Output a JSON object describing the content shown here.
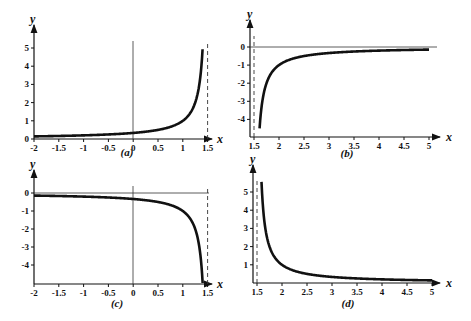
{
  "chart_data": [
    {
      "type": "line",
      "caption": "(a)",
      "xlabel": "x",
      "ylabel": "y",
      "xlim": [
        -2,
        1.5
      ],
      "ylim": [
        0,
        5.3
      ],
      "xticks": [
        "-2",
        "-1.5",
        "-1",
        "-0.5",
        "0",
        "0.5",
        "1",
        "1.5"
      ],
      "yticks": [
        "0",
        "1",
        "2",
        "3",
        "4",
        "5"
      ],
      "asymptote_x": 1.5,
      "function": "y = 1/(3-2x)",
      "x": [
        -2,
        -1.5,
        -1,
        -0.5,
        0,
        0.5,
        1,
        1.25,
        1.4
      ],
      "values": [
        0.14,
        0.17,
        0.2,
        0.25,
        0.33,
        0.5,
        1,
        2,
        5
      ]
    },
    {
      "type": "line",
      "caption": "(b)",
      "xlabel": "x",
      "ylabel": "y",
      "xlim": [
        1.45,
        5
      ],
      "ylim": [
        -4.9,
        0.5
      ],
      "xticks": [
        "1.5",
        "2",
        "2.5",
        "3",
        "3.5",
        "4",
        "4.5",
        "5"
      ],
      "yticks": [
        "0",
        "-1",
        "-2",
        "-3",
        "-4"
      ],
      "asymptote_x": 1.5,
      "function": "y = 1/(3-2x)",
      "x": [
        1.6,
        1.75,
        2,
        2.5,
        3,
        3.5,
        4,
        4.5,
        5
      ],
      "values": [
        -5,
        -2,
        -1,
        -0.5,
        -0.33,
        -0.25,
        -0.2,
        -0.17,
        -0.14
      ]
    },
    {
      "type": "line",
      "caption": "(c)",
      "xlabel": "x",
      "ylabel": "y",
      "xlim": [
        -2,
        1.5
      ],
      "ylim": [
        -5,
        0.3
      ],
      "xticks": [
        "-2",
        "-1.5",
        "-1",
        "-0.5",
        "0",
        "0.5",
        "1",
        "1.5"
      ],
      "yticks": [
        "0",
        "-1",
        "-2",
        "-3",
        "-4"
      ],
      "asymptote_x": 1.5,
      "function": "y = -1/(3-2x)",
      "x": [
        -2,
        -1.5,
        -1,
        -0.5,
        0,
        0.5,
        1,
        1.25,
        1.4
      ],
      "values": [
        -0.14,
        -0.17,
        -0.2,
        -0.25,
        -0.33,
        -0.5,
        -1,
        -2,
        -5
      ]
    },
    {
      "type": "line",
      "caption": "(d)",
      "xlabel": "x",
      "ylabel": "y",
      "xlim": [
        1.45,
        5
      ],
      "ylim": [
        0,
        5.3
      ],
      "xticks": [
        "1.5",
        "2",
        "2.5",
        "3",
        "3.5",
        "4",
        "4.5",
        "5"
      ],
      "yticks": [
        "1",
        "2",
        "3",
        "4",
        "5"
      ],
      "asymptote_x": 1.5,
      "function": "y = 1/(2x-3)",
      "x": [
        1.6,
        1.75,
        2,
        2.5,
        3,
        3.5,
        4,
        4.5,
        5
      ],
      "values": [
        5,
        2,
        1,
        0.5,
        0.33,
        0.25,
        0.2,
        0.17,
        0.14
      ]
    }
  ]
}
